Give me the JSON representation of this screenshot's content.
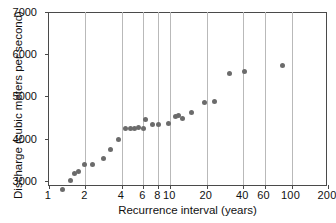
{
  "chart_data": {
    "type": "scatter",
    "title": "",
    "xlabel": "Recurrence interval (years)",
    "ylabel": "Discharge (cubic meters per second)",
    "xscale": "log",
    "yscale": "linear",
    "xlim": [
      1,
      200
    ],
    "ylim": [
      2880,
      7000
    ],
    "grid": "vertical-only",
    "legend": "none",
    "marker_color": "#6b6b6b",
    "axis_color": "#4a4a4a",
    "grid_color": "#b9b9b9",
    "xticks": [
      {
        "value": 1,
        "label": "1"
      },
      {
        "value": 2,
        "label": "2"
      },
      {
        "value": 4,
        "label": "4"
      },
      {
        "value": 6,
        "label": "6"
      },
      {
        "value": 8,
        "label": "8"
      },
      {
        "value": 10,
        "label": "10"
      },
      {
        "value": 20,
        "label": "20"
      },
      {
        "value": 40,
        "label": "40"
      },
      {
        "value": 60,
        "label": "60"
      },
      {
        "value": 100,
        "label": "100"
      },
      {
        "value": 200,
        "label": "200"
      }
    ],
    "gridlines_x": [
      2,
      4,
      6,
      8,
      10,
      20,
      40,
      60,
      100
    ],
    "yticks": [
      {
        "value": 3000,
        "label": "3000"
      },
      {
        "value": 4000,
        "label": "4000"
      },
      {
        "value": 5000,
        "label": "5000"
      },
      {
        "value": 6000,
        "label": "6000"
      },
      {
        "value": 7000,
        "label": "7000"
      }
    ],
    "points": [
      {
        "x": 1.3,
        "y": 2790
      },
      {
        "x": 1.5,
        "y": 3020
      },
      {
        "x": 1.62,
        "y": 3180
      },
      {
        "x": 1.75,
        "y": 3215
      },
      {
        "x": 1.95,
        "y": 3380
      },
      {
        "x": 2.3,
        "y": 3400
      },
      {
        "x": 2.8,
        "y": 3520
      },
      {
        "x": 3.2,
        "y": 3740
      },
      {
        "x": 3.75,
        "y": 3970
      },
      {
        "x": 4.3,
        "y": 4240
      },
      {
        "x": 4.7,
        "y": 4245
      },
      {
        "x": 5.1,
        "y": 4250
      },
      {
        "x": 5.5,
        "y": 4260
      },
      {
        "x": 6.0,
        "y": 4250
      },
      {
        "x": 6.2,
        "y": 4450
      },
      {
        "x": 7.1,
        "y": 4335
      },
      {
        "x": 8.0,
        "y": 4330
      },
      {
        "x": 9.7,
        "y": 4360
      },
      {
        "x": 11.0,
        "y": 4530
      },
      {
        "x": 11.8,
        "y": 4560
      },
      {
        "x": 12.5,
        "y": 4490
      },
      {
        "x": 15.0,
        "y": 4630
      },
      {
        "x": 19.0,
        "y": 4855
      },
      {
        "x": 23.0,
        "y": 4890
      },
      {
        "x": 31.0,
        "y": 5550
      },
      {
        "x": 41.0,
        "y": 5590
      },
      {
        "x": 85.0,
        "y": 5745
      }
    ]
  }
}
